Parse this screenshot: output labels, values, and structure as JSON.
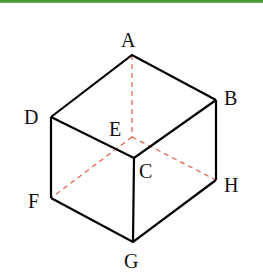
{
  "figure": {
    "type": "cube-diagram",
    "accent_color": "#4a9a3a",
    "edge_color": "#000000",
    "hidden_edge_color": "#e0604a",
    "vertices": {
      "A": {
        "label": "A",
        "x": 132,
        "y": 55
      },
      "B": {
        "label": "B",
        "x": 216,
        "y": 100
      },
      "C": {
        "label": "C",
        "x": 134,
        "y": 158
      },
      "D": {
        "label": "D",
        "x": 51,
        "y": 117
      },
      "E": {
        "label": "E",
        "x": 132,
        "y": 137
      },
      "F": {
        "label": "F",
        "x": 51,
        "y": 198
      },
      "G": {
        "label": "G",
        "x": 133,
        "y": 242
      },
      "H": {
        "label": "H",
        "x": 216,
        "y": 180
      }
    },
    "visible_edges": [
      "AB",
      "AD",
      "DC",
      "CB",
      "DF",
      "CG",
      "BH",
      "FG",
      "GH"
    ],
    "hidden_edges": [
      "AE",
      "EF",
      "EH"
    ]
  }
}
